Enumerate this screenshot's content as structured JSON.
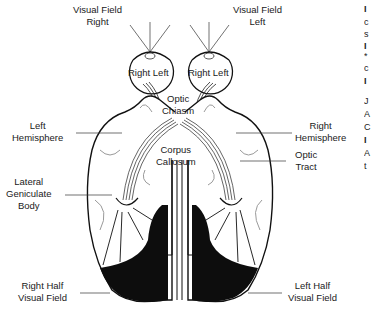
{
  "diagram": {
    "type": "anatomical-visual-pathway",
    "labels": {
      "visual_field_right": [
        "Visual Field",
        "Right"
      ],
      "visual_field_left": [
        "Visual Field",
        "Left"
      ],
      "eye_left_retina": [
        "Right",
        "Left"
      ],
      "eye_right_retina": [
        "Right",
        "Left"
      ],
      "optic_chiasm": [
        "Optic",
        "Chiasm"
      ],
      "corpus_callosum": [
        "Corpus",
        "Callosum"
      ],
      "left_hemisphere": [
        "Left",
        "Hemisphere"
      ],
      "right_hemisphere": [
        "Right",
        "Hemisphere"
      ],
      "optic_tract": [
        "Optic",
        "Tract"
      ],
      "lateral_geniculate_body": [
        "Lateral",
        "Geniculate",
        "Body"
      ],
      "right_half_visual_field": [
        "Right Half",
        "Visual Field"
      ],
      "left_half_visual_field": [
        "Left Half",
        "Visual Field"
      ]
    },
    "edge_fragments": [
      "I",
      "c",
      "s",
      "I",
      "*",
      "c",
      "I",
      "J",
      "A",
      "C",
      "I",
      "A",
      "t"
    ],
    "colors": {
      "ink": "#1a1a1a",
      "fill_cortex": "#0d0d0d",
      "background": "#ffffff",
      "gray_line": "#9a9a9a"
    }
  }
}
